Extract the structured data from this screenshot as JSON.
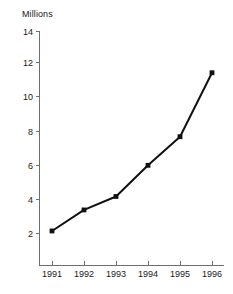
{
  "chart_data": {
    "type": "line",
    "title": "",
    "subtitle": "",
    "ylabel": "Millions",
    "xlabel": "",
    "categories": [
      "1991",
      "1992",
      "1993",
      "1994",
      "1995",
      "1996"
    ],
    "x": [
      1991,
      1992,
      1993,
      1994,
      1995,
      1996
    ],
    "values": [
      2.15,
      3.4,
      4.2,
      6.05,
      7.75,
      11.55
    ],
    "series": [
      {
        "name": "Millions",
        "values": [
          2.15,
          3.4,
          4.2,
          6.05,
          7.75,
          11.55
        ]
      }
    ],
    "ylim": [
      0,
      14
    ],
    "yticks": [
      2,
      4,
      6,
      8,
      10,
      12,
      14
    ],
    "ytick_labels": [
      "2",
      "4",
      "6",
      "8",
      "10",
      "12",
      "14"
    ],
    "xtick_labels": [
      "1991",
      "1992",
      "1993",
      "1994",
      "1995",
      "1996"
    ],
    "grid": false,
    "legend": false,
    "legend_position": "none",
    "marker": "square",
    "line_color": "#111111",
    "axis_color": "#6e6e6e",
    "background_color": "#ffffff"
  }
}
